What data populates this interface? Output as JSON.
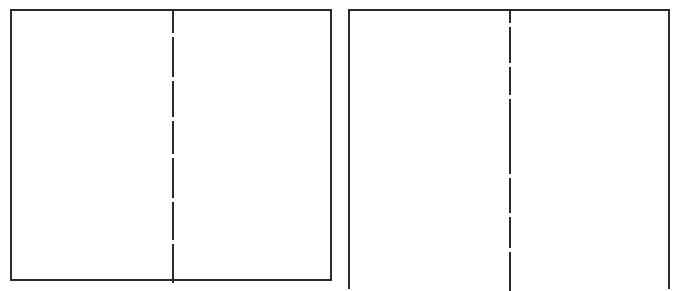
{
  "diagram": {
    "line_color": "#2a2a2a",
    "panels": [
      {
        "id": "left",
        "fold_x": 162,
        "segments": [
          [
            0,
            22
          ],
          [
            26,
            66
          ],
          [
            70,
            106
          ],
          [
            110,
            143
          ],
          [
            147,
            187
          ],
          [
            191,
            229
          ],
          [
            233,
            272
          ]
        ]
      },
      {
        "id": "right",
        "fold_x": 161,
        "segments": [
          [
            0,
            12
          ],
          [
            16,
            52
          ],
          [
            56,
            84
          ],
          [
            88,
            163
          ],
          [
            167,
            202
          ],
          [
            206,
            237
          ],
          [
            241,
            280
          ]
        ]
      }
    ]
  }
}
